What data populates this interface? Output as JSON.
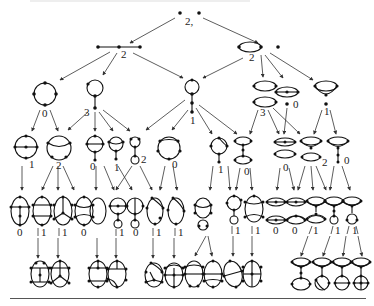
{
  "diagram": {
    "root": {
      "label": "2,"
    },
    "level1": [
      {
        "id": "path3",
        "label": "2"
      },
      {
        "id": "loop-plus-point",
        "label": "2"
      }
    ],
    "level2": [
      {
        "id": "circle4",
        "label": "0"
      },
      {
        "id": "circle-tail",
        "label": "3"
      },
      {
        "id": "circle-stick",
        "label": "1"
      },
      {
        "id": "two-ovals",
        "label": "3"
      },
      {
        "id": "theta-point",
        "label": "0"
      },
      {
        "id": "bowl",
        "label": "1"
      }
    ],
    "level3_labels": [
      "1",
      "2",
      "0",
      "1",
      "2",
      "0",
      "1",
      "0",
      "0",
      "1",
      "2",
      "0"
    ],
    "level4_labels": [
      "0",
      "1",
      "1",
      "0",
      "1",
      "1",
      "0",
      "1",
      "1",
      "1",
      "1",
      "1",
      "0",
      "0",
      "1",
      "1",
      "1"
    ],
    "edge_color": "#333333",
    "vertex_color": "#111111"
  }
}
